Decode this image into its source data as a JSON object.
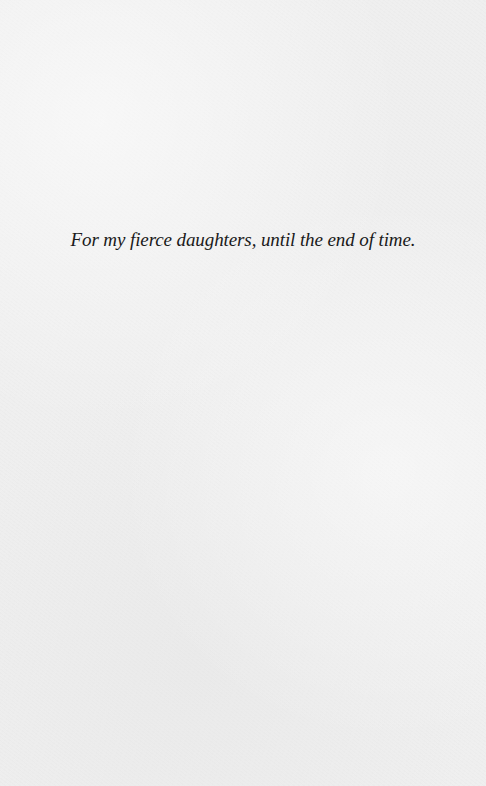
{
  "page": {
    "type": "dedication",
    "background_color": "#efefef",
    "text_color": "#1a1a1a"
  },
  "dedication": {
    "text": "For my fierce daughters, until the end of time."
  }
}
